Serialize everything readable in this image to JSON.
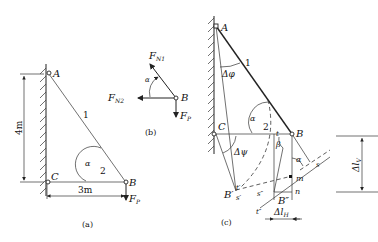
{
  "figure_a": {
    "caption": "(a)",
    "points": {
      "A": "A",
      "B": "B",
      "C": "C"
    },
    "bar1": "1",
    "bar2": "2",
    "angle": "α",
    "height_dim": "4m",
    "width_dim": "3m",
    "force": "F",
    "force_sub": "P"
  },
  "figure_b": {
    "caption": "(b)",
    "point": "B",
    "angle": "α",
    "force_n1": "F",
    "force_n1_sub": "N1",
    "force_n2": "F",
    "force_n2_sub": "N2",
    "force_p": "F",
    "force_p_sub": "P"
  },
  "figure_c": {
    "caption": "(c)",
    "points": {
      "A": "A",
      "B": "B",
      "C": "C",
      "B_prime": "B′",
      "B_double": "B″"
    },
    "bar1": "1",
    "bar2": "2",
    "angle_alpha": "α",
    "angle_alpha2": "α",
    "angle_beta": "β",
    "delta_phi": "Δφ",
    "delta_psi": "Δψ",
    "labels": {
      "t": "t",
      "t_prime": "t′",
      "t_double": "t″",
      "s": "s",
      "s_prime": "s′",
      "s_double": "s″",
      "m": "m",
      "n": "n"
    },
    "delta_lh": "Δl",
    "delta_lh_sub": "H",
    "delta_lv": "Δl",
    "delta_lv_sub": "V"
  }
}
